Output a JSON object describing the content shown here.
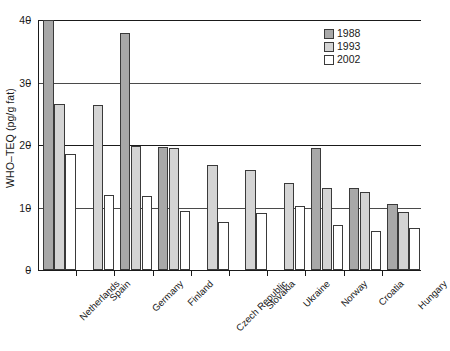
{
  "chart_data": {
    "type": "bar",
    "title": "",
    "subtitle": "",
    "xlabel": "",
    "ylabel": "WHO–TEQ (pg/g fat)",
    "ylim": [
      0,
      40
    ],
    "yticks": [
      0,
      10,
      20,
      30,
      40
    ],
    "ytick_labels": [
      "0",
      "10",
      "20",
      "30",
      "40"
    ],
    "grid": "horizontal",
    "legend_position": "top-right",
    "categories": [
      "Netherlands",
      "Spain",
      "Germany",
      "Finland",
      "Czech Republic",
      "Slovakia",
      "Ukraine",
      "Norway",
      "Croatia",
      "Hungary"
    ],
    "series": [
      {
        "name": "1988",
        "color": "#a8a8a8",
        "values": [
          40.0,
          null,
          37.9,
          19.7,
          null,
          null,
          null,
          19.6,
          13.1,
          10.5
        ]
      },
      {
        "name": "1993",
        "color": "#d4d4d4",
        "values": [
          26.5,
          26.4,
          19.8,
          19.5,
          16.8,
          16.0,
          13.9,
          13.2,
          12.5,
          9.3
        ]
      },
      {
        "name": "2002",
        "color": "#ffffff",
        "values": [
          18.5,
          12.0,
          11.9,
          9.5,
          7.7,
          9.2,
          10.2,
          7.2,
          6.2,
          6.7
        ]
      }
    ],
    "notes": {
      "clipped_bars": "Netherlands 1988 bar is truncated at the top of the axis (value at or above 40)"
    }
  },
  "legend": {
    "entries": [
      {
        "label": "1988",
        "swatch": "s1988"
      },
      {
        "label": "1993",
        "swatch": "s1993"
      },
      {
        "label": "2002",
        "swatch": "s2002"
      }
    ]
  }
}
